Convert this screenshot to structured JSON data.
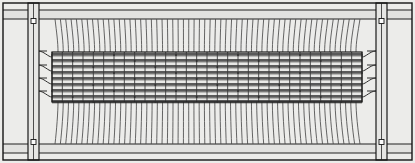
{
  "figure": {
    "view": "front elevation",
    "width_px": 415,
    "height_px": 163,
    "background_color": "#f2f2f0",
    "paper_color": "#ececea",
    "line_color": "#1a1a1a",
    "weft_color": "#2a2a2a",
    "warp_color": "#4a4a4a"
  },
  "outer_frame": {
    "name": "outer border rectangle",
    "x": 3,
    "y": 3,
    "width": 409,
    "height": 157,
    "stroke": "#141414"
  },
  "rails": {
    "top": {
      "label": "top rail",
      "y": 10,
      "height": 9,
      "x": 3,
      "width": 409
    },
    "bottom": {
      "label": "bottom rail",
      "y": 144,
      "height": 9,
      "x": 3,
      "width": 409
    },
    "inner_top_line_y": 19,
    "inner_bottom_line_y": 144
  },
  "posts": [
    {
      "label": "left vertical post",
      "side": "left",
      "x": 28,
      "width": 11,
      "y": 3,
      "height": 157
    },
    {
      "label": "right vertical post",
      "side": "right",
      "x": 376,
      "width": 11,
      "y": 3,
      "height": 157
    }
  ],
  "bolts": [
    {
      "label": "top-left bolt",
      "cx": 33.5,
      "cy": 21,
      "size": 5
    },
    {
      "label": "bottom-left bolt",
      "cx": 33.5,
      "cy": 142,
      "size": 5
    },
    {
      "label": "top-right bolt",
      "cx": 381.5,
      "cy": 21,
      "size": 5
    },
    {
      "label": "bottom-right bolt",
      "cx": 381.5,
      "cy": 142,
      "size": 5
    }
  ],
  "warp": {
    "label": "vertical warp wires",
    "count": 58,
    "x_start": 55,
    "x_end": 360,
    "y_top": 19,
    "y_bottom": 144,
    "color": "#4a4a4a"
  },
  "weave_panel": {
    "label": "central woven mesh panel",
    "x": 52,
    "y": 52,
    "width": 310,
    "height": 50,
    "fill": "#e8e8e6",
    "weft_rows": 9,
    "weft_row_y": [
      54,
      60,
      66,
      72,
      78,
      84,
      90,
      96,
      101
    ],
    "binder_columns": 30,
    "knot_radius": 1.0
  },
  "leads": {
    "label": "side lead-in wire bundles connecting mesh to posts",
    "left": {
      "from_x": 38,
      "to_x": 52,
      "rows": 4,
      "y": [
        57,
        71,
        84,
        97
      ]
    },
    "right": {
      "from_x": 362,
      "to_x": 376,
      "rows": 4,
      "y": [
        57,
        71,
        84,
        97
      ]
    }
  }
}
